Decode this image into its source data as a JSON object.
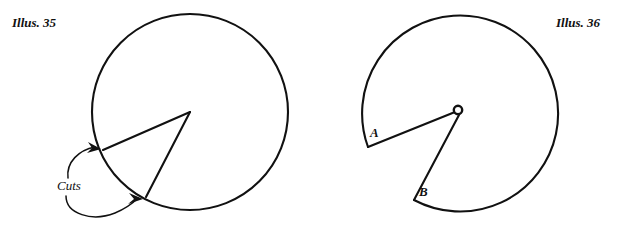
{
  "page": {
    "width": 640,
    "height": 226,
    "background_color": "#ffffff",
    "ink_color": "#111111"
  },
  "figures": [
    {
      "id": "illus-35",
      "caption": "Illus. 35",
      "caption_position": {
        "x": 12,
        "y": 27
      },
      "description": "Circle with two straight cut lines drawn from the center to the circumference, forming a wedge, labelled with the word Cuts and two curved arrows.",
      "circle": {
        "cx": 190,
        "cy": 112,
        "r": 98
      },
      "cut_lines": [
        {
          "name": "cut-upper",
          "from": {
            "x": 190,
            "y": 112
          },
          "to": {
            "x": 103,
            "y": 150
          }
        },
        {
          "name": "cut-lower",
          "from": {
            "x": 190,
            "y": 112
          },
          "to": {
            "x": 146,
            "y": 197
          }
        }
      ],
      "annotation": {
        "label": "Cuts",
        "label_position": {
          "x": 57,
          "y": 190
        },
        "arrows": [
          {
            "name": "cuts-arrow-upper",
            "target": {
              "x": 101,
              "y": 149
            }
          },
          {
            "name": "cuts-arrow-lower",
            "target": {
              "x": 143,
              "y": 199
            }
          }
        ]
      }
    },
    {
      "id": "illus-36",
      "caption": "Illus. 36",
      "caption_position": {
        "x": 556,
        "y": 27
      },
      "description": "Circle with the wedge removed leaving an open notch; the two cut edges are labelled A and B and meet at a small hole at the center.",
      "circle": {
        "cx": 458,
        "cy": 111,
        "r": 98
      },
      "hub": {
        "cx": 458,
        "cy": 110,
        "r": 4.5
      },
      "cut_edges": [
        {
          "name": "edge-a",
          "label": "A",
          "from": {
            "x": 458,
            "y": 112
          },
          "to": {
            "x": 368,
            "y": 147
          },
          "label_position": {
            "x": 370,
            "y": 137
          }
        },
        {
          "name": "edge-b",
          "label": "B",
          "from": {
            "x": 459,
            "y": 114
          },
          "to": {
            "x": 414,
            "y": 200
          },
          "label_position": {
            "x": 419,
            "y": 196
          }
        }
      ]
    }
  ]
}
